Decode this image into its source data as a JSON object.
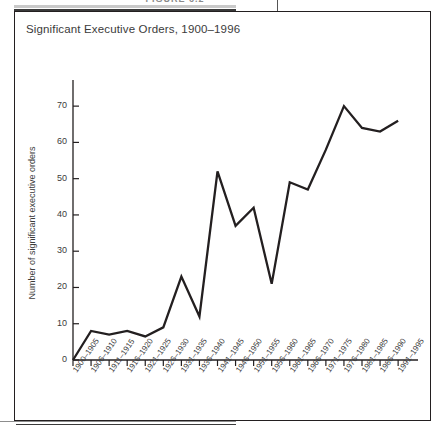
{
  "figure": {
    "caption_label": "FIGURE 6.2",
    "border_color": "#231f20"
  },
  "chart": {
    "title": "Significant Executive Orders, 1900–1996",
    "ylabel": "Number of significant executive orders",
    "line_color": "#231f20",
    "text_color": "#3b3b3b"
  },
  "chart_data": {
    "type": "line",
    "title": "Significant Executive Orders, 1900–1996",
    "xlabel": "",
    "ylabel": "Number of significant executive orders",
    "ylim": [
      0,
      75
    ],
    "yticks": [
      0,
      10,
      20,
      30,
      40,
      50,
      60,
      70
    ],
    "grid": false,
    "legend": "none",
    "categories": [
      "1900–1905",
      "1906–1910",
      "1911–1915",
      "1916–1920",
      "1921–1925",
      "1926–1930",
      "1931–1935",
      "1936–1940",
      "1941–1945",
      "1946–1950",
      "1951–1955",
      "1956–1960",
      "1961–1965",
      "1966–1970",
      "1971–1975",
      "1976–1980",
      "1981–1985",
      "1986–1990",
      "1991–1995"
    ],
    "values": [
      0,
      8,
      7,
      8,
      6.5,
      9,
      23,
      12,
      52,
      37,
      42,
      21,
      49,
      47,
      58,
      70,
      64,
      63,
      66
    ]
  }
}
